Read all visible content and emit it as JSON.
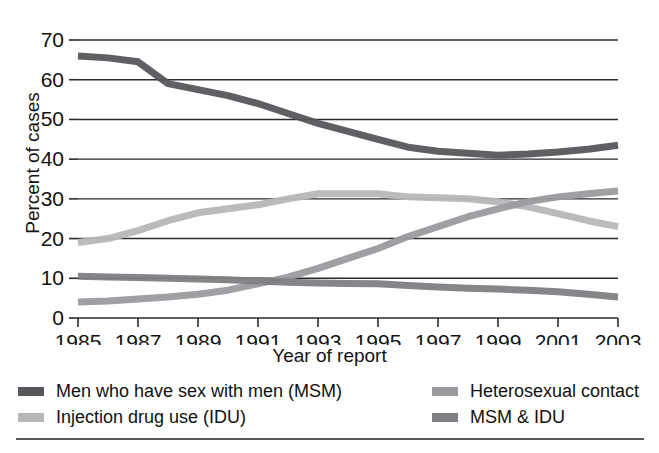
{
  "chart_data": {
    "type": "line",
    "title": "",
    "xlabel": "Year of report",
    "ylabel": "Percent of cases",
    "xlim": [
      1985,
      2003
    ],
    "ylim": [
      0,
      70
    ],
    "ytick_step": 10,
    "grid": "horizontal",
    "legend_position": "bottom",
    "x": [
      1985,
      1986,
      1987,
      1988,
      1989,
      1990,
      1991,
      1992,
      1993,
      1994,
      1995,
      1996,
      1997,
      1998,
      1999,
      2000,
      2001,
      2002,
      2003
    ],
    "xticks": [
      1985,
      1987,
      1989,
      1991,
      1993,
      1995,
      1997,
      1999,
      2001,
      2003
    ],
    "yticks": [
      0,
      10,
      20,
      30,
      40,
      50,
      60,
      70
    ],
    "series": [
      {
        "name": "Men who have sex with men (MSM)",
        "color": "#56575b",
        "values": [
          66.0,
          65.5,
          64.5,
          59.0,
          57.5,
          56.0,
          54.0,
          51.5,
          49.0,
          47.0,
          45.0,
          43.0,
          42.0,
          41.5,
          41.0,
          41.3,
          41.8,
          42.5,
          43.5
        ]
      },
      {
        "name": "Injection drug use (IDU)",
        "color": "#b6b7b9",
        "values": [
          19.0,
          20.0,
          22.0,
          24.5,
          26.5,
          27.5,
          28.5,
          30.0,
          31.3,
          31.3,
          31.3,
          30.5,
          30.3,
          30.0,
          29.3,
          28.0,
          26.3,
          24.5,
          23.0
        ]
      },
      {
        "name": "Heterosexual contact",
        "color": "#9a9b9e",
        "values": [
          4.0,
          4.3,
          4.8,
          5.3,
          6.0,
          7.0,
          8.6,
          10.3,
          12.5,
          15.0,
          17.5,
          20.5,
          23.0,
          25.5,
          27.5,
          29.3,
          30.5,
          31.3,
          32.0
        ]
      },
      {
        "name": "MSM & IDU",
        "color": "#7e7f83",
        "values": [
          10.5,
          10.3,
          10.2,
          10.0,
          9.8,
          9.6,
          9.3,
          9.0,
          8.8,
          8.7,
          8.6,
          8.2,
          7.8,
          7.5,
          7.3,
          7.0,
          6.6,
          6.0,
          5.3
        ]
      }
    ]
  },
  "axes": {
    "ylabel": "Percent of cases",
    "xlabel": "Year of report",
    "ytick_labels": [
      "0",
      "10",
      "20",
      "30",
      "40",
      "50",
      "60",
      "70"
    ],
    "xtick_labels": [
      "1985",
      "1987",
      "1989",
      "1991",
      "1993",
      "1995",
      "1997",
      "1999",
      "2001",
      "2003"
    ]
  },
  "legend": {
    "entries": [
      {
        "label": "Men who have sex with men (MSM)",
        "color": "#56575b",
        "column": "left"
      },
      {
        "label": "Injection drug use (IDU)",
        "color": "#b6b7b9",
        "column": "left"
      },
      {
        "label": "Heterosexual contact",
        "color": "#9a9b9e",
        "column": "right"
      },
      {
        "label": "MSM & IDU",
        "color": "#7e7f83",
        "column": "right"
      }
    ]
  }
}
